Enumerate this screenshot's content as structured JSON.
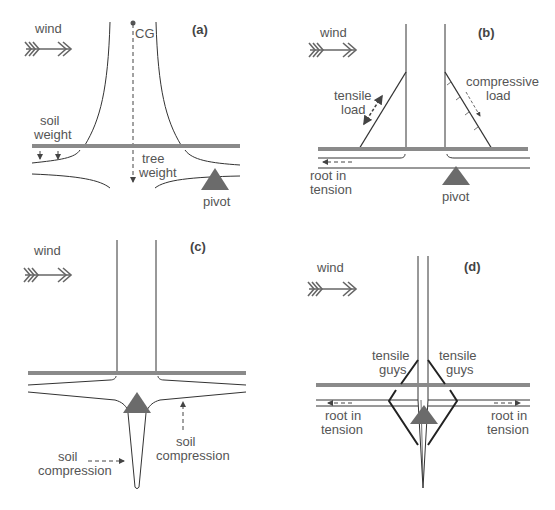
{
  "figure": {
    "panels": [
      {
        "id": "a",
        "panel_label": "(a)",
        "wind_label": "wind",
        "labels": {
          "cg": "CG",
          "soil_weight_1": "soil",
          "soil_weight_2": "weight",
          "tree_weight_1": "tree",
          "tree_weight_2": "weight",
          "pivot": "pivot"
        }
      },
      {
        "id": "b",
        "panel_label": "(b)",
        "wind_label": "wind",
        "labels": {
          "tensile_1": "tensile",
          "tensile_2": "load",
          "compressive_1": "compressive",
          "compressive_2": "load",
          "root_1": "root in",
          "root_2": "tension",
          "pivot": "pivot"
        }
      },
      {
        "id": "c",
        "panel_label": "(c)",
        "wind_label": "wind",
        "labels": {
          "soil_comp_left_1": "soil",
          "soil_comp_left_2": "compression",
          "soil_comp_right_1": "soil",
          "soil_comp_right_2": "compression"
        }
      },
      {
        "id": "d",
        "panel_label": "(d)",
        "wind_label": "wind",
        "labels": {
          "guys_left_1": "tensile",
          "guys_left_2": "guys",
          "guys_right_1": "tensile",
          "guys_right_2": "guys",
          "root_left_1": "root in",
          "root_left_2": "tension",
          "root_right_1": "root in",
          "root_right_2": "tension"
        }
      }
    ],
    "colors": {
      "ground": "#8a8a8a",
      "line": "#333333",
      "pivot": "#6b6b6b",
      "text": "#555555"
    }
  }
}
